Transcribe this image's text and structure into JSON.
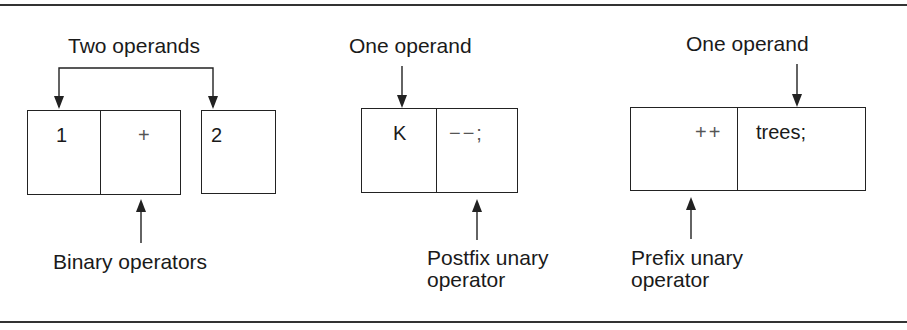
{
  "figure": {
    "binary": {
      "top_label": "Two operands",
      "bottom_label": "Binary operators",
      "cells": [
        "1",
        "+",
        "2"
      ]
    },
    "postfix": {
      "top_label": "One operand",
      "bottom_label_line1": "Postfix unary",
      "bottom_label_line2": "operator",
      "cells": [
        "K",
        "−−;"
      ]
    },
    "prefix": {
      "top_label": "One operand",
      "bottom_label_line1": "Prefix unary",
      "bottom_label_line2": "operator",
      "cells": [
        "++",
        "trees;"
      ]
    }
  }
}
